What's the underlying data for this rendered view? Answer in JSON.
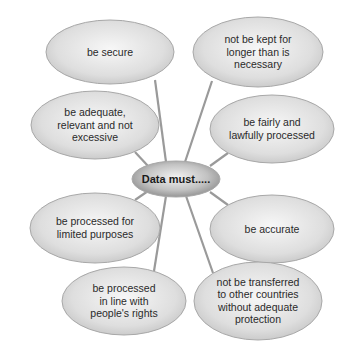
{
  "diagram": {
    "center": {
      "label": "Data must....."
    },
    "principles": [
      {
        "id": "secure",
        "lines": [
          "be secure"
        ]
      },
      {
        "id": "not-kept-longer",
        "lines": [
          "not be kept for",
          "longer than is",
          "necessary"
        ]
      },
      {
        "id": "adequate",
        "lines": [
          "be adequate,",
          "relevant and not",
          "excessive"
        ]
      },
      {
        "id": "fairly-lawfully",
        "lines": [
          "be fairly and",
          "lawfully processed"
        ]
      },
      {
        "id": "limited-purposes",
        "lines": [
          "be processed for",
          "limited purposes"
        ]
      },
      {
        "id": "accurate",
        "lines": [
          "be accurate"
        ]
      },
      {
        "id": "peoples-rights",
        "lines": [
          "be processed",
          "in line with",
          "people's rights"
        ]
      },
      {
        "id": "not-transferred",
        "lines": [
          "not be transferred",
          "to other countries",
          "without adequate",
          "protection"
        ]
      }
    ],
    "colors": {
      "bubble_light": "#f4f4f4",
      "bubble_dark": "#c8c8c8",
      "center_light": "#eeeeee",
      "center_dark": "#8e8e8e",
      "connector": "#9a9a9a",
      "text": "#2a2a2a"
    }
  }
}
